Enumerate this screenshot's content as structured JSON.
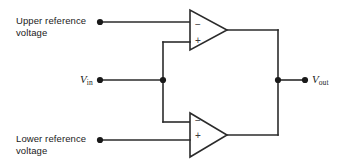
{
  "diagram": {
    "background_color": "#ffffff",
    "line_color": "#2b2b2b",
    "labels": {
      "upper_reference_line1": "Upper reference",
      "upper_reference_line2": "voltage",
      "lower_reference_line1": "Lower reference",
      "lower_reference_line2": "voltage",
      "vin_main": "V",
      "vin_sub": "in",
      "vout_main": "V",
      "vout_sub": "out"
    },
    "opamps": [
      {
        "id": "upper-comparator",
        "name": "Upper comparator",
        "inverting_sign": "−",
        "noninverting_sign": "+",
        "inverting_input": "Upper reference voltage",
        "noninverting_input": "Vin"
      },
      {
        "id": "lower-comparator",
        "name": "Lower comparator",
        "inverting_sign": "−",
        "noninverting_sign": "+",
        "inverting_input": "Vin",
        "noninverting_input": "Lower reference voltage"
      }
    ],
    "terminals": [
      {
        "id": "upper-reference-terminal",
        "label": "Upper reference voltage"
      },
      {
        "id": "vin-terminal",
        "label": "Vin"
      },
      {
        "id": "lower-reference-terminal",
        "label": "Lower reference voltage"
      },
      {
        "id": "vout-terminal",
        "label": "Vout"
      }
    ],
    "junctions": [
      {
        "id": "vin-junction",
        "label": "Vin node"
      },
      {
        "id": "vout-junction",
        "label": "Vout node"
      }
    ]
  }
}
